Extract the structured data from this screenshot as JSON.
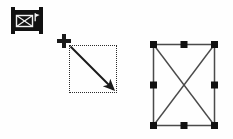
{
  "figure": {
    "background_color": "#fefefe",
    "ink_color": "#1a1a1a",
    "alt": "Illustration of drawing a crossed-box object: tool button, crosshair cursor, dotted drag marquee with diagonal arrow, and finished selected rectangle with X diagonals and eight handles"
  },
  "tool_icon": {
    "name": "crossed-box-tool-button",
    "label": "",
    "body_color": "#111111",
    "glyph_color": "#f2f2f2",
    "glyph": "rectangle-with-x",
    "has_flag_marker": true
  },
  "cursor": {
    "name": "crosshair-cursor",
    "glyph": "plus",
    "color": "#1a1a1a"
  },
  "drag_marquee": {
    "name": "dotted-drag-rectangle",
    "border_style": "dotted",
    "border_color": "#2b2b2b",
    "fill": "transparent",
    "arrow": {
      "name": "drag-direction-arrow",
      "direction": "top-left-to-bottom-right",
      "color": "#1a1a1a"
    }
  },
  "selected_shape": {
    "name": "selected-crossed-rectangle",
    "outline_color": "#4a4a4a",
    "diagonal_color": "#4a4a4a",
    "handle_color": "#111111",
    "handle_count": 8,
    "handles": [
      "top-left",
      "top-center",
      "top-right",
      "middle-left",
      "middle-right",
      "bottom-left",
      "bottom-center",
      "bottom-right"
    ]
  }
}
